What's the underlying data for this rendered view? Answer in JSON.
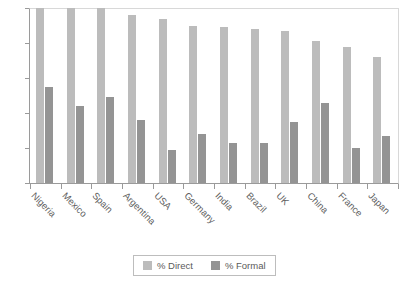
{
  "chart_data": {
    "type": "bar",
    "title": "",
    "subtitle": "",
    "xlabel": "",
    "ylabel": "",
    "ylim": [
      0,
      100
    ],
    "yticks": [
      0,
      20,
      40,
      60,
      80,
      100
    ],
    "grid": false,
    "legend_position": "bottom",
    "categories": [
      "Nigeria",
      "Mexico",
      "Spain",
      "Argentina",
      "USA",
      "Germany",
      "India",
      "Brazil",
      "UK",
      "China",
      "France",
      "Japan"
    ],
    "series": [
      {
        "name": "% Direct",
        "color": "#bcbcbc",
        "values": [
          100,
          100,
          100,
          96,
          94,
          90,
          89,
          88,
          87,
          81,
          78,
          72
        ]
      },
      {
        "name": "% Formal",
        "color": "#949494",
        "values": [
          55,
          44,
          49,
          36,
          19,
          28,
          23,
          23,
          35,
          46,
          20,
          27
        ]
      }
    ]
  },
  "legend": {
    "items": [
      {
        "label": "% Direct"
      },
      {
        "label": "% Formal"
      }
    ]
  },
  "axis": {
    "y_tick_labels": [
      "0",
      "20",
      "40",
      "60",
      "80",
      "100"
    ]
  }
}
